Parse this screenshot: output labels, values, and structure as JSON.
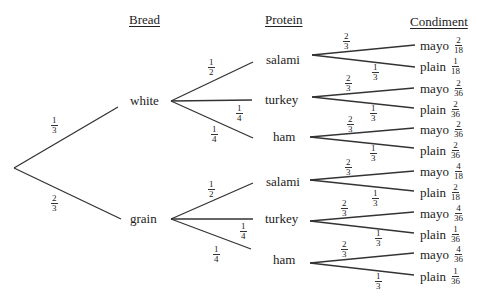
{
  "headers": {
    "bread": "Bread",
    "protein": "Protein",
    "condiment": "Condiment"
  },
  "bread": [
    {
      "label": "white",
      "prob": {
        "num": "1",
        "den": "3"
      }
    },
    {
      "label": "grain",
      "prob": {
        "num": "2",
        "den": "3"
      }
    }
  ],
  "protein": {
    "white": [
      {
        "label": "salami",
        "prob": {
          "num": "1",
          "den": "2"
        }
      },
      {
        "label": "turkey",
        "prob": {
          "num": "1",
          "den": "4"
        }
      },
      {
        "label": "ham",
        "prob": {
          "num": "1",
          "den": "4"
        }
      }
    ],
    "grain": [
      {
        "label": "salami",
        "prob": {
          "num": "1",
          "den": "2"
        }
      },
      {
        "label": "turkey",
        "prob": {
          "num": "1",
          "den": "4"
        }
      },
      {
        "label": "ham",
        "prob": {
          "num": "1",
          "den": "4"
        }
      }
    ]
  },
  "condiment_branch_probs": {
    "mayo": {
      "num": "2",
      "den": "3"
    },
    "plain": {
      "num": "1",
      "den": "3"
    }
  },
  "leaves": [
    {
      "label": "mayo",
      "num": "2",
      "den": "18"
    },
    {
      "label": "plain",
      "num": "1",
      "den": "18"
    },
    {
      "label": "mayo",
      "num": "2",
      "den": "36"
    },
    {
      "label": "plain",
      "num": "2",
      "den": "36"
    },
    {
      "label": "mayo",
      "num": "2",
      "den": "36"
    },
    {
      "label": "plain",
      "num": "2",
      "den": "36"
    },
    {
      "label": "mayo",
      "num": "4",
      "den": "18"
    },
    {
      "label": "plain",
      "num": "2",
      "den": "18"
    },
    {
      "label": "mayo",
      "num": "4",
      "den": "36"
    },
    {
      "label": "plain",
      "num": "1",
      "den": "36"
    },
    {
      "label": "mayo",
      "num": "4",
      "den": "36"
    },
    {
      "label": "plain",
      "num": "1",
      "den": "36"
    }
  ]
}
